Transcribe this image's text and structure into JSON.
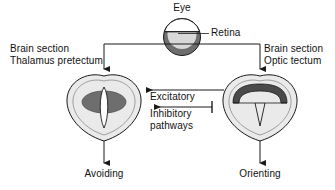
{
  "figure": {
    "background_color": "#ffffff",
    "line_color": "#1a1a1a",
    "text_color": "#111111"
  },
  "eye": {
    "label": "Eye",
    "retina_label": "Retina",
    "outline_color": "#1a1a1a",
    "sclera_fill": "#ffffff",
    "retina_fill": "#6e6e6e",
    "vitreous_fill": "#d8d8d8"
  },
  "left_brain": {
    "label_line1": "Brain section",
    "label_line2": "Thalamus pretectum",
    "outcome_label": "Avoiding",
    "body_fill": "#eaeaea",
    "nucleus_fill": "#6e6e6e",
    "ventricle_fill": "#ffffff"
  },
  "right_brain": {
    "label_line1": "Brain section",
    "label_line2": "Optic tectum",
    "outcome_label": "Orienting",
    "body_fill": "#eaeaea",
    "tectum_fill": "#4a4a4a",
    "ventricle_fill": "#ffffff"
  },
  "pathways": {
    "excitatory_label": "Excitatory",
    "inhibitory_label_line1": "Inhibitory",
    "inhibitory_label_line2": "pathways"
  }
}
